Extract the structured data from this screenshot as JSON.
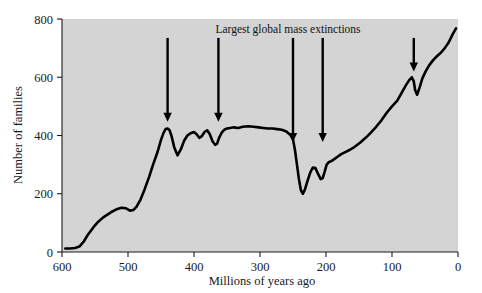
{
  "chart_data": {
    "type": "line",
    "title": "",
    "xlabel": "Millions of years ago",
    "ylabel": "Number of families",
    "xlim": [
      600,
      0
    ],
    "ylim": [
      0,
      800
    ],
    "x_reversed": true,
    "grid": false,
    "legend": "none",
    "plot_background": "#d4d4d4",
    "line_color": "#000000",
    "xticks": [
      600,
      500,
      400,
      300,
      200,
      100,
      0
    ],
    "xtick_labels": [
      "600",
      "500",
      "400",
      "300",
      "200",
      "100",
      "0"
    ],
    "yticks": [
      0,
      200,
      400,
      600,
      800
    ],
    "ytick_labels": [
      "0",
      "200",
      "400",
      "600",
      "800"
    ],
    "series": [
      {
        "name": "Number of families",
        "x": [
          595,
          588,
          580,
          573,
          567,
          560,
          552,
          545,
          538,
          530,
          523,
          516,
          510,
          503,
          497,
          492,
          487,
          481,
          475,
          468,
          462,
          455,
          450,
          446,
          443,
          440,
          437,
          434,
          430,
          425,
          420,
          415,
          410,
          405,
          400,
          396,
          392,
          388,
          384,
          380,
          376,
          372,
          368,
          365,
          362,
          358,
          354,
          350,
          345,
          340,
          333,
          326,
          318,
          310,
          302,
          295,
          288,
          281,
          274,
          267,
          260,
          254,
          250,
          247,
          244,
          241,
          238,
          235,
          232,
          228,
          224,
          220,
          216,
          212,
          208,
          205,
          202,
          199,
          196,
          192,
          188,
          183,
          177,
          170,
          163,
          156,
          148,
          140,
          132,
          124,
          116,
          108,
          100,
          92,
          85,
          79,
          74,
          70,
          67,
          65,
          62,
          58,
          54,
          49,
          44,
          38,
          32,
          26,
          20,
          14,
          8,
          3
        ],
        "y": [
          12,
          12,
          14,
          20,
          36,
          62,
          86,
          104,
          118,
          130,
          140,
          148,
          152,
          150,
          142,
          144,
          156,
          180,
          214,
          258,
          300,
          345,
          385,
          410,
          422,
          424,
          418,
          398,
          360,
          332,
          352,
          382,
          400,
          408,
          412,
          404,
          392,
          398,
          412,
          418,
          404,
          380,
          368,
          372,
          392,
          410,
          420,
          424,
          426,
          428,
          426,
          430,
          432,
          430,
          428,
          426,
          424,
          424,
          422,
          420,
          414,
          402,
          386,
          350,
          300,
          250,
          212,
          200,
          214,
          244,
          272,
          290,
          288,
          268,
          250,
          254,
          276,
          300,
          308,
          312,
          318,
          326,
          336,
          344,
          352,
          362,
          376,
          392,
          410,
          430,
          452,
          478,
          500,
          520,
          548,
          572,
          590,
          600,
          586,
          556,
          540,
          566,
          596,
          620,
          640,
          658,
          672,
          684,
          700,
          720,
          748,
          768
        ]
      }
    ],
    "annotations": [
      {
        "text": "Largest global mass extinctions",
        "x_pixel_center": 288,
        "y_pixel": 33,
        "type": "label"
      }
    ],
    "arrows": [
      {
        "name": "ordovician-extinction-arrow",
        "x_ma": 440,
        "tip_y_value": 447,
        "top_y_value": 735
      },
      {
        "name": "devonian-extinction-arrow",
        "x_ma": 363,
        "tip_y_value": 447,
        "top_y_value": 735
      },
      {
        "name": "permian-extinction-arrow",
        "x_ma": 250,
        "tip_y_value": 378,
        "top_y_value": 735
      },
      {
        "name": "triassic-extinction-arrow",
        "x_ma": 205,
        "tip_y_value": 378,
        "top_y_value": 735
      },
      {
        "name": "cretaceous-extinction-arrow",
        "x_ma": 67,
        "tip_y_value": 620,
        "top_y_value": 735
      }
    ]
  }
}
